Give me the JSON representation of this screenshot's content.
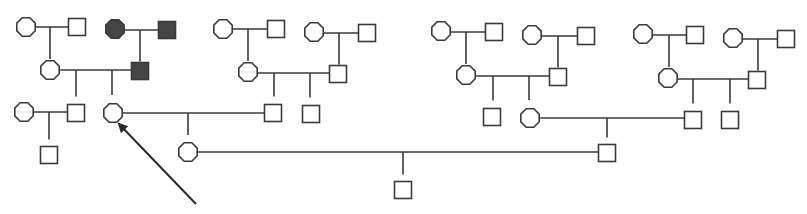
{
  "diagram": {
    "type": "pedigree",
    "colors": {
      "line": "#3a3a3a",
      "affected_fill": "#454545",
      "unaffected_fill": "#ffffff",
      "arrow": "#2a2a2a"
    },
    "individuals": [
      {
        "id": "I1",
        "sex": "female",
        "affected": false,
        "x": 26,
        "y": 27,
        "gen": 1
      },
      {
        "id": "I2",
        "sex": "male",
        "affected": false,
        "x": 77,
        "y": 27,
        "gen": 1
      },
      {
        "id": "I3",
        "sex": "female",
        "affected": true,
        "x": 115,
        "y": 29,
        "gen": 1
      },
      {
        "id": "I4",
        "sex": "male",
        "affected": true,
        "x": 167,
        "y": 30,
        "gen": 1
      },
      {
        "id": "I5",
        "sex": "female",
        "affected": false,
        "x": 223,
        "y": 29,
        "gen": 1
      },
      {
        "id": "I6",
        "sex": "male",
        "affected": false,
        "x": 276,
        "y": 29,
        "gen": 1
      },
      {
        "id": "I7",
        "sex": "female",
        "affected": false,
        "x": 314,
        "y": 32,
        "gen": 1
      },
      {
        "id": "I8",
        "sex": "male",
        "affected": false,
        "x": 367,
        "y": 33,
        "gen": 1
      },
      {
        "id": "I9",
        "sex": "female",
        "affected": false,
        "x": 441,
        "y": 31,
        "gen": 1
      },
      {
        "id": "I10",
        "sex": "male",
        "affected": false,
        "x": 494,
        "y": 32,
        "gen": 1
      },
      {
        "id": "I11",
        "sex": "female",
        "affected": false,
        "x": 532,
        "y": 35,
        "gen": 1
      },
      {
        "id": "I12",
        "sex": "male",
        "affected": false,
        "x": 586,
        "y": 36,
        "gen": 1
      },
      {
        "id": "I13",
        "sex": "female",
        "affected": false,
        "x": 643,
        "y": 34,
        "gen": 1
      },
      {
        "id": "I14",
        "sex": "male",
        "affected": false,
        "x": 695,
        "y": 35,
        "gen": 1
      },
      {
        "id": "I15",
        "sex": "female",
        "affected": false,
        "x": 733,
        "y": 38,
        "gen": 1
      },
      {
        "id": "I16",
        "sex": "male",
        "affected": false,
        "x": 786,
        "y": 39,
        "gen": 1
      },
      {
        "id": "II1",
        "sex": "female",
        "affected": false,
        "x": 50,
        "y": 70,
        "gen": 2
      },
      {
        "id": "II2",
        "sex": "male",
        "affected": true,
        "x": 140,
        "y": 71,
        "gen": 2
      },
      {
        "id": "II3",
        "sex": "female",
        "affected": false,
        "x": 248,
        "y": 72,
        "gen": 2
      },
      {
        "id": "II4",
        "sex": "male",
        "affected": false,
        "x": 338,
        "y": 74,
        "gen": 2
      },
      {
        "id": "II5",
        "sex": "female",
        "affected": false,
        "x": 466,
        "y": 75,
        "gen": 2
      },
      {
        "id": "II6",
        "sex": "male",
        "affected": false,
        "x": 558,
        "y": 77,
        "gen": 2
      },
      {
        "id": "II7",
        "sex": "female",
        "affected": false,
        "x": 668,
        "y": 78,
        "gen": 2
      },
      {
        "id": "II8",
        "sex": "male",
        "affected": false,
        "x": 757,
        "y": 80,
        "gen": 2
      },
      {
        "id": "III1",
        "sex": "female",
        "affected": false,
        "x": 24,
        "y": 112,
        "gen": 3
      },
      {
        "id": "III2",
        "sex": "male",
        "affected": false,
        "x": 76,
        "y": 113,
        "gen": 3
      },
      {
        "id": "III3",
        "sex": "female",
        "affected": false,
        "x": 113,
        "y": 113,
        "gen": 3,
        "proband": true
      },
      {
        "id": "III4",
        "sex": "male",
        "affected": false,
        "x": 273,
        "y": 113,
        "gen": 3
      },
      {
        "id": "III5",
        "sex": "male",
        "affected": false,
        "x": 311,
        "y": 114,
        "gen": 3
      },
      {
        "id": "III6",
        "sex": "male",
        "affected": false,
        "x": 492,
        "y": 117,
        "gen": 3
      },
      {
        "id": "III7",
        "sex": "female",
        "affected": false,
        "x": 530,
        "y": 118,
        "gen": 3
      },
      {
        "id": "III8",
        "sex": "male",
        "affected": false,
        "x": 693,
        "y": 120,
        "gen": 3
      },
      {
        "id": "III9",
        "sex": "male",
        "affected": false,
        "x": 730,
        "y": 120,
        "gen": 3
      },
      {
        "id": "IV1",
        "sex": "male",
        "affected": false,
        "x": 49,
        "y": 155,
        "gen": 4
      },
      {
        "id": "IV2",
        "sex": "female",
        "affected": false,
        "x": 188,
        "y": 152,
        "gen": 4
      },
      {
        "id": "IV3",
        "sex": "male",
        "affected": false,
        "x": 607,
        "y": 153,
        "gen": 4
      },
      {
        "id": "V1",
        "sex": "male",
        "affected": false,
        "x": 403,
        "y": 190,
        "gen": 5
      }
    ],
    "relationships": [
      {
        "partners": [
          "I1",
          "I2"
        ],
        "line_y": 27,
        "drop_x": 50,
        "children": [
          "II1"
        ]
      },
      {
        "partners": [
          "I3",
          "I4"
        ],
        "line_y": 30,
        "drop_x": 140,
        "children": [
          "II2"
        ]
      },
      {
        "partners": [
          "I5",
          "I6"
        ],
        "line_y": 29,
        "drop_x": 248,
        "children": [
          "II3"
        ]
      },
      {
        "partners": [
          "I7",
          "I8"
        ],
        "line_y": 33,
        "drop_x": 339,
        "children": [
          "II4"
        ]
      },
      {
        "partners": [
          "I9",
          "I10"
        ],
        "line_y": 32,
        "drop_x": 466,
        "children": [
          "II5"
        ]
      },
      {
        "partners": [
          "I11",
          "I12"
        ],
        "line_y": 36,
        "drop_x": 558,
        "children": [
          "II6"
        ]
      },
      {
        "partners": [
          "I13",
          "I14"
        ],
        "line_y": 35,
        "drop_x": 669,
        "children": [
          "II7"
        ]
      },
      {
        "partners": [
          "I15",
          "I16"
        ],
        "line_y": 39,
        "drop_x": 758,
        "children": [
          "II8"
        ]
      },
      {
        "partners": [
          "II1",
          "II2"
        ],
        "line_y": 70,
        "drops_x": [
          76,
          112
        ],
        "children": [
          "III2",
          "III3"
        ]
      },
      {
        "partners": [
          "II3",
          "II4"
        ],
        "line_y": 73,
        "drops_x": [
          274,
          310
        ],
        "children": [
          "III4",
          "III5"
        ]
      },
      {
        "partners": [
          "II5",
          "II6"
        ],
        "line_y": 76,
        "drops_x": [
          493,
          529
        ],
        "children": [
          "III6",
          "III7"
        ]
      },
      {
        "partners": [
          "II7",
          "II8"
        ],
        "line_y": 79,
        "drops_x": [
          693,
          730
        ],
        "children": [
          "III8",
          "III9"
        ]
      },
      {
        "partners": [
          "III1",
          "III2"
        ],
        "line_y": 112,
        "drop_x": 49,
        "children": [
          "IV1"
        ]
      },
      {
        "partners": [
          "III3",
          "III4"
        ],
        "line_y": 113,
        "drop_x": 188,
        "children": [
          "IV2"
        ]
      },
      {
        "partners": [
          "III7",
          "III8"
        ],
        "line_y": 118,
        "drop_x": 607,
        "children": [
          "IV3"
        ]
      },
      {
        "partners": [
          "IV2",
          "IV3"
        ],
        "line_y": 152,
        "drop_x": 403,
        "children": [
          "V1"
        ]
      }
    ],
    "proband_arrow": {
      "from": [
        196,
        204
      ],
      "to": [
        119,
        124
      ],
      "points_to": "III3"
    }
  }
}
